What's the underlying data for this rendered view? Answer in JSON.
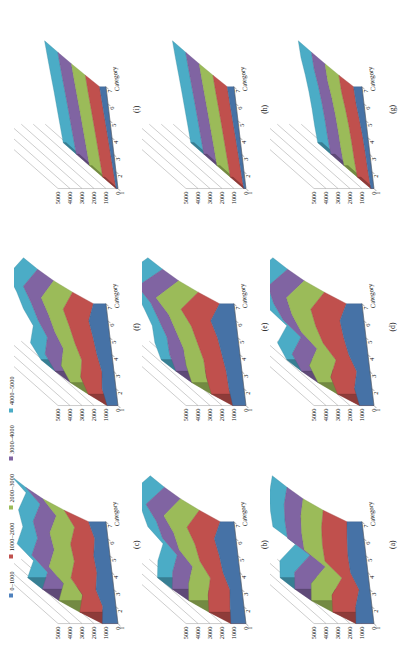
{
  "figure": {
    "type": "multi-panel-3d-surface-grid",
    "rows": 3,
    "cols": 3,
    "rotation_note": "page scanned sideways; content rotated -90 degrees"
  },
  "legend": {
    "position": "top-left",
    "items": [
      {
        "label": "0–1000",
        "color": "#4f81bd"
      },
      {
        "label": "1000–2000",
        "color": "#c0504d"
      },
      {
        "label": "2000–3000",
        "color": "#9bbb59"
      },
      {
        "label": "3000–4000",
        "color": "#8064a2"
      },
      {
        "label": "4000–5000",
        "color": "#4bacc6"
      }
    ]
  },
  "axes": {
    "z_ticks": [
      "5000",
      "4000",
      "3000",
      "2000",
      "1000",
      "0"
    ],
    "z_values": [
      5000,
      4000,
      3000,
      2000,
      1000,
      0
    ],
    "z_min": 0,
    "z_max": 5000,
    "category_axis_title": "Category",
    "category_ticks": [
      "1",
      "2",
      "3",
      "4",
      "5",
      "6",
      "7"
    ]
  },
  "panels": [
    {
      "id": "c",
      "caption": "(c)",
      "row": 0,
      "col": 0
    },
    {
      "id": "f",
      "caption": "(f)",
      "row": 0,
      "col": 1
    },
    {
      "id": "i",
      "caption": "(i)",
      "row": 0,
      "col": 2
    },
    {
      "id": "b",
      "caption": "(b)",
      "row": 1,
      "col": 0
    },
    {
      "id": "e",
      "caption": "(e)",
      "row": 1,
      "col": 1
    },
    {
      "id": "h",
      "caption": "(h)",
      "row": 1,
      "col": 2
    },
    {
      "id": "a",
      "caption": "(a)",
      "row": 2,
      "col": 0
    },
    {
      "id": "d",
      "caption": "(d)",
      "row": 2,
      "col": 1
    },
    {
      "id": "g",
      "caption": "(g)",
      "row": 2,
      "col": 2
    }
  ],
  "chart_data": {
    "type": "line",
    "title": "",
    "xlabel": "Category",
    "ylabel": "",
    "zlabel": "",
    "ylim": [
      0,
      5000
    ],
    "grid": true,
    "legend_position": "top-left",
    "categories": [
      "1",
      "2",
      "3",
      "4",
      "5",
      "6",
      "7"
    ],
    "band_legend": [
      "0–1000",
      "1000–2000",
      "2000–3000",
      "3000–4000",
      "4000–5000"
    ],
    "panels": [
      {
        "panel": "(a)",
        "series": [
          {
            "name": "0–1000",
            "values": [
              1500,
              1350,
              900,
              1450,
              1500,
              1400,
              1250
            ]
          },
          {
            "name": "1000–2000",
            "values": [
              2350,
              2250,
              1250,
              2500,
              2550,
              2450,
              2150
            ]
          },
          {
            "name": "2000–3000",
            "values": [
              3050,
              2900,
              1550,
              3150,
              3200,
              3100,
              2750
            ]
          },
          {
            "name": "3000–4000",
            "values": [
              3350,
              3200,
              1750,
              3450,
              3500,
              3400,
              3000
            ]
          },
          {
            "name": "4000–5000",
            "values": [
              3500,
              3350,
              1850,
              3600,
              3650,
              3550,
              3150
            ]
          }
        ]
      },
      {
        "panel": "(b)",
        "series": [
          {
            "name": "0–1000",
            "values": [
              1250,
              1150,
              1000,
              1400,
              1550,
              1800,
              1150
            ]
          },
          {
            "name": "1000–2000",
            "values": [
              2000,
              1900,
              1550,
              2250,
              2500,
              3000,
              1800
            ]
          },
          {
            "name": "2000–3000",
            "values": [
              2600,
              2450,
              1950,
              2900,
              3200,
              3850,
              2300
            ]
          },
          {
            "name": "3000–4000",
            "values": [
              2900,
              2700,
              2150,
              3200,
              3550,
              4250,
              2550
            ]
          },
          {
            "name": "4000–5000",
            "values": [
              3050,
              2850,
              2250,
              3350,
              3700,
              4450,
              2650
            ]
          }
        ]
      },
      {
        "panel": "(c)",
        "series": [
          {
            "name": "0–1000",
            "values": [
              1300,
              1100,
              1500,
              1250,
              1350,
              1100,
              1450
            ]
          },
          {
            "name": "1000–2000",
            "values": [
              2100,
              1700,
              2500,
              2050,
              2200,
              1700,
              2400
            ]
          },
          {
            "name": "2000–3000",
            "values": [
              2750,
              2200,
              3250,
              2650,
              2850,
              2150,
              3100
            ]
          },
          {
            "name": "3000–4000",
            "values": [
              3050,
              2450,
              3600,
              2950,
              3150,
              2400,
              3450
            ]
          },
          {
            "name": "4000–5000",
            "values": [
              3200,
              2550,
              3750,
              3100,
              3300,
              2500,
              3600
            ]
          }
        ]
      },
      {
        "panel": "(d)",
        "series": [
          {
            "name": "0–1000",
            "values": [
              1200,
              1450,
              1100,
              1600,
              1850,
              2000,
              1300
            ]
          },
          {
            "name": "1000–2000",
            "values": [
              1950,
              2350,
              1750,
              2650,
              3100,
              3350,
              2050
            ]
          },
          {
            "name": "2000–3000",
            "values": [
              2500,
              3050,
              2250,
              3400,
              4000,
              4300,
              2650
            ]
          },
          {
            "name": "3000–4000",
            "values": [
              2800,
              3400,
              2500,
              3800,
              4450,
              4750,
              2950
            ]
          },
          {
            "name": "4000–5000",
            "values": [
              2950,
              3550,
              2600,
              3950,
              4650,
              4950,
              3100
            ]
          }
        ]
      },
      {
        "panel": "(e)",
        "series": [
          {
            "name": "0–1000",
            "values": [
              1100,
              1250,
              1300,
              1500,
              1700,
              2100,
              1200
            ]
          },
          {
            "name": "1000–2000",
            "values": [
              1800,
              2050,
              2100,
              2450,
              2800,
              3500,
              1900
            ]
          },
          {
            "name": "2000–3000",
            "values": [
              2350,
              2650,
              2700,
              3150,
              3600,
              4500,
              2450
            ]
          },
          {
            "name": "3000–4000",
            "values": [
              2600,
              2950,
              3000,
              3500,
              4000,
              4950,
              2700
            ]
          },
          {
            "name": "4000–5000",
            "values": [
              2750,
              3100,
              3150,
              3650,
              4200,
              5000,
              2850
            ]
          }
        ]
      },
      {
        "panel": "(f)",
        "series": [
          {
            "name": "0–1000",
            "values": [
              900,
              1150,
              1000,
              1250,
              1400,
              1600,
              1050
            ]
          },
          {
            "name": "1000–2000",
            "values": [
              1400,
              1850,
              1600,
              2000,
              2300,
              2650,
              1700
            ]
          },
          {
            "name": "2000–3000",
            "values": [
              1800,
              2400,
              2050,
              2600,
              2950,
              3400,
              2200
            ]
          },
          {
            "name": "3000–4000",
            "values": [
              2000,
              2650,
              2300,
              2900,
              3300,
              3800,
              2450
            ]
          },
          {
            "name": "4000–5000",
            "values": [
              2100,
              2800,
              2400,
              3050,
              3450,
              4000,
              2550
            ]
          }
        ]
      },
      {
        "panel": "(g)",
        "series": [
          {
            "name": "0–1000",
            "values": [
              250,
              320,
              360,
              420,
              520,
              650,
              700
            ]
          },
          {
            "name": "1000–2000",
            "values": [
              300,
              380,
              430,
              500,
              620,
              780,
              840
            ]
          },
          {
            "name": "2000–3000",
            "values": [
              330,
              420,
              470,
              550,
              680,
              860,
              920
            ]
          },
          {
            "name": "3000–4000",
            "values": [
              350,
              440,
              490,
              580,
              710,
              900,
              960
            ]
          },
          {
            "name": "4000–5000",
            "values": [
              360,
              450,
              500,
              590,
              730,
              920,
              980
            ]
          }
        ]
      },
      {
        "panel": "(h)",
        "series": [
          {
            "name": "0–1000",
            "values": [
              180,
              240,
              300,
              360,
              430,
              500,
              560
            ]
          },
          {
            "name": "1000–2000",
            "values": [
              220,
              290,
              360,
              430,
              510,
              600,
              670
            ]
          },
          {
            "name": "2000–3000",
            "values": [
              250,
              320,
              400,
              480,
              570,
              660,
              740
            ]
          },
          {
            "name": "3000–4000",
            "values": [
              265,
              340,
              420,
              505,
              600,
              695,
              780
            ]
          },
          {
            "name": "4000–5000",
            "values": [
              275,
              350,
              435,
              520,
              615,
              715,
              800
            ]
          }
        ]
      },
      {
        "panel": "(i)",
        "series": [
          {
            "name": "0–1000",
            "values": [
              150,
              210,
              270,
              330,
              400,
              470,
              530
            ]
          },
          {
            "name": "1000–2000",
            "values": [
              185,
              255,
              325,
              400,
              480,
              565,
              635
            ]
          },
          {
            "name": "2000–3000",
            "values": [
              210,
              290,
              370,
              450,
              545,
              640,
              720
            ]
          },
          {
            "name": "3000–4000",
            "values": [
              225,
              310,
              395,
              480,
              580,
              680,
              765
            ]
          },
          {
            "name": "4000–5000",
            "values": [
              235,
              320,
              410,
              495,
              600,
              700,
              790
            ]
          }
        ]
      }
    ]
  }
}
